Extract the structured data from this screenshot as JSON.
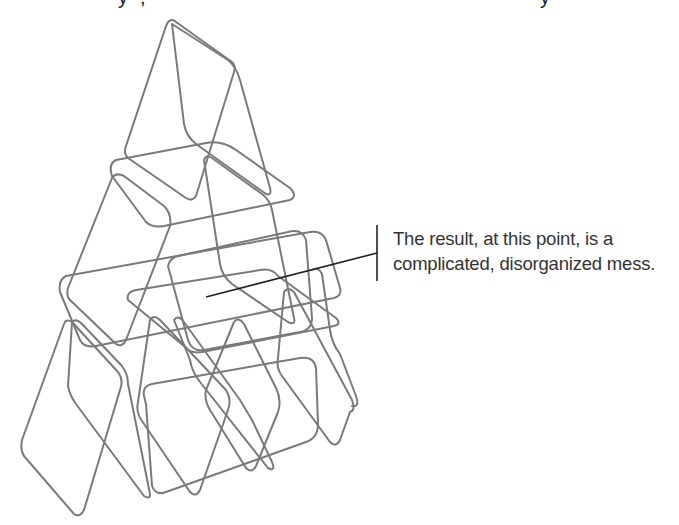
{
  "figure": {
    "stroke_color": "#7a7a7a",
    "leader_color": "#222222",
    "text_color": "#333333"
  },
  "callout": {
    "lines": [
      "The result, at this point, is a",
      "complicated, disorganized mess."
    ]
  },
  "top_fragment": {
    "glyphs": [
      "y",
      ",",
      "y"
    ]
  }
}
